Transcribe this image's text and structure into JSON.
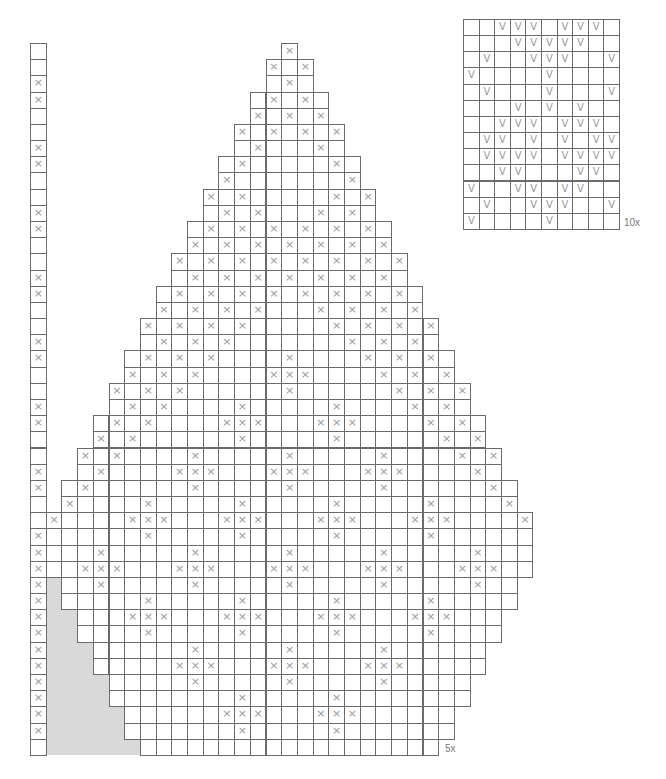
{
  "figure": {
    "type": "knitting-chart",
    "cell_color": "#ffffff",
    "line_color": "#6a6a6a",
    "symbol_color": "#9a9a9a",
    "shade_color": "#d9d9d9"
  },
  "left_column": {
    "rows": 44,
    "col": 0,
    "x_rows": [
      2,
      3,
      6,
      7,
      10,
      11,
      14,
      15,
      18,
      19,
      22,
      23,
      26,
      27,
      30,
      31,
      32,
      33,
      34,
      35,
      36,
      37,
      38,
      39,
      40,
      41,
      42
    ],
    "symbol": "×"
  },
  "main_chart": {
    "symbol": "×",
    "repeat_label": "5x",
    "rows": [
      {
        "r": 0,
        "start": 16,
        "end": 16,
        "x": [
          16
        ]
      },
      {
        "r": 1,
        "start": 15,
        "end": 17,
        "x": [
          15,
          17
        ]
      },
      {
        "r": 2,
        "start": 15,
        "end": 17,
        "x": [
          16
        ]
      },
      {
        "r": 3,
        "start": 14,
        "end": 18,
        "x": [
          15,
          17
        ]
      },
      {
        "r": 4,
        "start": 14,
        "end": 18,
        "x": [
          14,
          16,
          18
        ]
      },
      {
        "r": 5,
        "start": 13,
        "end": 19,
        "x": [
          13,
          15,
          17,
          19
        ]
      },
      {
        "r": 6,
        "start": 13,
        "end": 19,
        "x": [
          14,
          18
        ]
      },
      {
        "r": 7,
        "start": 12,
        "end": 20,
        "x": [
          13,
          19
        ]
      },
      {
        "r": 8,
        "start": 12,
        "end": 20,
        "x": [
          12,
          20
        ]
      },
      {
        "r": 9,
        "start": 11,
        "end": 21,
        "x": [
          11,
          13,
          19,
          21
        ]
      },
      {
        "r": 10,
        "start": 11,
        "end": 21,
        "x": [
          12,
          14,
          18,
          20
        ]
      },
      {
        "r": 11,
        "start": 10,
        "end": 22,
        "x": [
          11,
          13,
          15,
          17,
          19,
          21
        ]
      },
      {
        "r": 12,
        "start": 10,
        "end": 22,
        "x": [
          10,
          12,
          14,
          16,
          18,
          20,
          22
        ]
      },
      {
        "r": 13,
        "start": 9,
        "end": 23,
        "x": [
          9,
          11,
          13,
          15,
          17,
          19,
          21,
          23
        ]
      },
      {
        "r": 14,
        "start": 9,
        "end": 23,
        "x": [
          10,
          12,
          14,
          16,
          18,
          20,
          22
        ]
      },
      {
        "r": 15,
        "start": 8,
        "end": 24,
        "x": [
          9,
          11,
          13,
          15,
          17,
          19,
          21,
          23
        ]
      },
      {
        "r": 16,
        "start": 8,
        "end": 24,
        "x": [
          8,
          10,
          12,
          14,
          18,
          20,
          22,
          24
        ]
      },
      {
        "r": 17,
        "start": 7,
        "end": 25,
        "x": [
          7,
          9,
          11,
          13,
          19,
          21,
          23,
          25
        ]
      },
      {
        "r": 18,
        "start": 7,
        "end": 25,
        "x": [
          8,
          10,
          12,
          20,
          22,
          24
        ]
      },
      {
        "r": 19,
        "start": 6,
        "end": 26,
        "x": [
          7,
          9,
          11,
          16,
          21,
          23,
          25
        ]
      },
      {
        "r": 20,
        "start": 6,
        "end": 26,
        "x": [
          6,
          8,
          10,
          15,
          16,
          17,
          22,
          24,
          26
        ]
      },
      {
        "r": 21,
        "start": 5,
        "end": 27,
        "x": [
          5,
          7,
          9,
          16,
          23,
          25,
          27
        ]
      },
      {
        "r": 22,
        "start": 5,
        "end": 27,
        "x": [
          6,
          8,
          13,
          19,
          24,
          26
        ]
      },
      {
        "r": 23,
        "start": 4,
        "end": 28,
        "x": [
          5,
          7,
          12,
          13,
          14,
          18,
          19,
          20,
          25,
          27
        ]
      },
      {
        "r": 24,
        "start": 4,
        "end": 28,
        "x": [
          4,
          6,
          13,
          19,
          26,
          28
        ]
      },
      {
        "r": 25,
        "start": 3,
        "end": 29,
        "x": [
          3,
          5,
          10,
          16,
          22,
          27,
          29
        ]
      },
      {
        "r": 26,
        "start": 3,
        "end": 29,
        "x": [
          4,
          9,
          10,
          11,
          15,
          16,
          17,
          21,
          22,
          23,
          28
        ]
      },
      {
        "r": 27,
        "start": 2,
        "end": 30,
        "x": [
          3,
          10,
          16,
          22,
          29
        ]
      },
      {
        "r": 28,
        "start": 2,
        "end": 30,
        "x": [
          2,
          7,
          13,
          19,
          25,
          30
        ]
      },
      {
        "r": 29,
        "start": 1,
        "end": 31,
        "x": [
          1,
          6,
          7,
          8,
          12,
          13,
          14,
          18,
          19,
          20,
          24,
          25,
          26,
          31
        ]
      },
      {
        "r": 30,
        "start": 1,
        "end": 31,
        "x": [
          7,
          13,
          19,
          25
        ]
      },
      {
        "r": 31,
        "start": 1,
        "end": 31,
        "x": [
          4,
          10,
          16,
          22,
          28
        ]
      },
      {
        "r": 32,
        "start": 1,
        "end": 31,
        "x": [
          3,
          4,
          5,
          9,
          10,
          11,
          15,
          16,
          17,
          21,
          22,
          23,
          27,
          28,
          29
        ]
      },
      {
        "r": 33,
        "start": 2,
        "end": 30,
        "x": [
          4,
          10,
          16,
          22,
          28
        ]
      },
      {
        "r": 34,
        "start": 2,
        "end": 30,
        "x": [
          7,
          13,
          19,
          25
        ]
      },
      {
        "r": 35,
        "start": 3,
        "end": 29,
        "x": [
          6,
          7,
          8,
          12,
          13,
          14,
          18,
          19,
          20,
          24,
          25,
          26
        ]
      },
      {
        "r": 36,
        "start": 3,
        "end": 29,
        "x": [
          7,
          13,
          19,
          25
        ]
      },
      {
        "r": 37,
        "start": 4,
        "end": 28,
        "x": [
          10,
          16,
          22
        ]
      },
      {
        "r": 38,
        "start": 4,
        "end": 28,
        "x": [
          9,
          10,
          11,
          15,
          16,
          17,
          21,
          22,
          23
        ]
      },
      {
        "r": 39,
        "start": 5,
        "end": 27,
        "x": [
          10,
          16,
          22
        ]
      },
      {
        "r": 40,
        "start": 5,
        "end": 27,
        "x": [
          13,
          19
        ]
      },
      {
        "r": 41,
        "start": 6,
        "end": 26,
        "x": [
          12,
          13,
          14,
          18,
          19,
          20
        ]
      },
      {
        "r": 42,
        "start": 6,
        "end": 26,
        "x": [
          13,
          19
        ]
      },
      {
        "r": 43,
        "start": 7,
        "end": 25,
        "x": []
      }
    ],
    "shaded_rows": [
      {
        "r": 33,
        "from": 1,
        "to": 1
      },
      {
        "r": 34,
        "from": 1,
        "to": 1
      },
      {
        "r": 35,
        "from": 1,
        "to": 2
      },
      {
        "r": 36,
        "from": 1,
        "to": 2
      },
      {
        "r": 37,
        "from": 1,
        "to": 3
      },
      {
        "r": 38,
        "from": 1,
        "to": 3
      },
      {
        "r": 39,
        "from": 1,
        "to": 4
      },
      {
        "r": 40,
        "from": 1,
        "to": 4
      },
      {
        "r": 41,
        "from": 1,
        "to": 5
      },
      {
        "r": 42,
        "from": 1,
        "to": 5
      },
      {
        "r": 43,
        "from": 1,
        "to": 6
      }
    ]
  },
  "small_chart": {
    "symbol": "V",
    "cols": 10,
    "repeat_label": "10x",
    "rows": [
      [
        2,
        3,
        4,
        6,
        7,
        8
      ],
      [
        3,
        4,
        5,
        6,
        7
      ],
      [
        1,
        4,
        5,
        6,
        9
      ],
      [
        0,
        5
      ],
      [
        1,
        5,
        9
      ],
      [
        3,
        5,
        7
      ],
      [
        2,
        3,
        4,
        6,
        7,
        8
      ],
      [
        1,
        2,
        4,
        6,
        8,
        9
      ],
      [
        1,
        2,
        3,
        4,
        6,
        7,
        8,
        9
      ],
      [
        2,
        3,
        7,
        8
      ],
      [
        0,
        3,
        4,
        6,
        7
      ],
      [
        1,
        4,
        5,
        6,
        9
      ],
      [
        0,
        5
      ]
    ]
  }
}
